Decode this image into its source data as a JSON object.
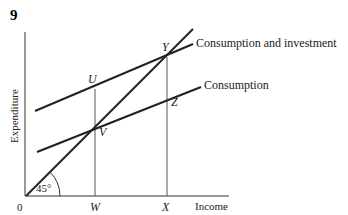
{
  "figure": {
    "number": "9",
    "axes": {
      "y_label": "Expenditure",
      "x_label": "Income",
      "origin_label": "0",
      "angle_label": "45°"
    },
    "lines": {
      "consumption_and_investment": "Consumption and investment",
      "consumption": "Consumption"
    },
    "points": {
      "U": "U",
      "V": "V",
      "Y": "Y",
      "Z": "Z"
    },
    "x_ticks": {
      "W": "W",
      "X": "X"
    },
    "colors": {
      "line": "#222222",
      "guide": "#555555",
      "background": "#ffffff"
    }
  }
}
